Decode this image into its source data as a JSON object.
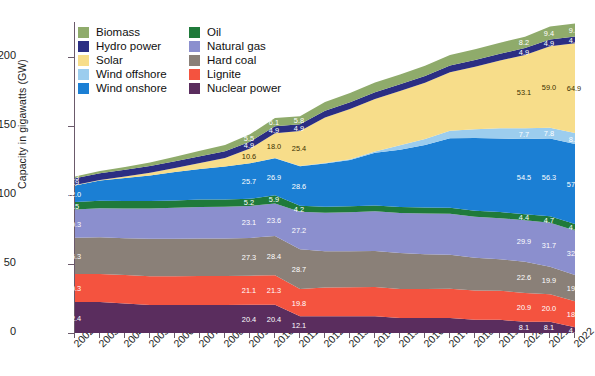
{
  "chart_data": {
    "type": "area",
    "stacked": true,
    "title": "",
    "xlabel": "",
    "ylabel": "Capacity in gigawatts (GW)",
    "ylim": [
      0,
      225
    ],
    "yticks": [
      0,
      50,
      100,
      150,
      200
    ],
    "grid": false,
    "legend_position": "top-left",
    "categories": [
      "2002",
      "2003",
      "2004",
      "2005",
      "2006",
      "2007",
      "2008",
      "2009",
      "2010",
      "2011",
      "2012",
      "2013",
      "2014",
      "2015",
      "2016",
      "2017",
      "2018",
      "2019",
      "2020",
      "2021",
      "2022"
    ],
    "series": [
      {
        "name": "Nuclear power",
        "color": "#5a2d5e",
        "values": [
          22.4,
          22.4,
          21.4,
          20.3,
          20.3,
          20.3,
          20.3,
          20.4,
          20.4,
          12.1,
          12.1,
          12.1,
          12.1,
          10.8,
          10.8,
          10.8,
          9.5,
          9.5,
          8.1,
          8.1,
          4.1
        ],
        "labels": {
          "2002": "22.4",
          "2009": "20.4",
          "2010": "20.4",
          "2011": "12.1",
          "2020": "8.1",
          "2021": "8.1",
          "2022": "4.1"
        }
      },
      {
        "name": "Lignite",
        "color": "#f4533f",
        "values": [
          20.3,
          20.3,
          20.5,
          20.8,
          20.8,
          20.9,
          20.9,
          21.1,
          21.3,
          19.8,
          20.8,
          21.0,
          21.2,
          21.1,
          21.1,
          21.2,
          21.2,
          21.1,
          20.9,
          20.0,
          18.9
        ],
        "labels": {
          "2002": "20.3",
          "2009": "21.1",
          "2010": "21.3",
          "2011": "19.8",
          "2020": "20.9",
          "2021": "20.0",
          "2022": "18.9"
        }
      },
      {
        "name": "Hard coal",
        "color": "#8a8078",
        "values": [
          26.3,
          26.5,
          26.7,
          27.0,
          27.1,
          27.2,
          27.2,
          27.3,
          28.4,
          28.7,
          26.3,
          26.0,
          26.0,
          25.9,
          25.1,
          24.6,
          23.7,
          22.7,
          22.6,
          19.9,
          19.0
        ],
        "labels": {
          "2002": "26.3",
          "2009": "27.3",
          "2010": "28.4",
          "2011": "28.7",
          "2020": "22.6",
          "2021": "19.9",
          "2022": "19.0"
        }
      },
      {
        "name": "Natural gas",
        "color": "#8b8fce",
        "values": [
          20.3,
          21.0,
          21.5,
          22.0,
          22.4,
          22.8,
          23.0,
          23.1,
          23.6,
          27.2,
          27.8,
          28.3,
          28.7,
          29.1,
          29.4,
          29.6,
          29.7,
          29.8,
          29.9,
          31.7,
          32.1
        ],
        "labels": {
          "2002": "20.3",
          "2009": "23.1",
          "2010": "23.6",
          "2011": "27.2",
          "2020": "29.9",
          "2021": "31.7",
          "2022": "32.1"
        }
      },
      {
        "name": "Oil",
        "color": "#1f7a3a",
        "values": [
          5.5,
          5.5,
          5.4,
          5.4,
          5.3,
          5.3,
          5.2,
          5.2,
          5.9,
          4.2,
          4.3,
          4.3,
          4.3,
          4.3,
          4.4,
          4.4,
          4.4,
          4.4,
          4.4,
          4.7,
          4.7
        ],
        "labels": {
          "2002": "5.5",
          "2009": "5.2",
          "2010": "5.9",
          "2011": "4.2",
          "2020": "4.4",
          "2021": "4.7",
          "2022": "4.7"
        }
      },
      {
        "name": "Wind onshore",
        "color": "#1b7fd4",
        "values": [
          12.0,
          14.6,
          16.6,
          18.4,
          20.6,
          22.2,
          23.9,
          25.7,
          26.9,
          28.6,
          31.3,
          33.5,
          38.1,
          41.3,
          45.3,
          50.3,
          52.5,
          53.2,
          54.5,
          56.3,
          57.9
        ],
        "labels": {
          "2002": "12.0",
          "2009": "25.7",
          "2010": "26.9",
          "2011": "28.6",
          "2020": "54.5",
          "2021": "56.3",
          "2022": "57.9"
        }
      },
      {
        "name": "Wind offshore",
        "color": "#9ccdee",
        "values": [
          0.0,
          0.0,
          0.0,
          0.0,
          0.0,
          0.0,
          0.0,
          0.0,
          0.1,
          0.2,
          0.3,
          0.5,
          1.0,
          3.3,
          4.2,
          5.4,
          6.4,
          7.5,
          7.7,
          7.8,
          8.0
        ],
        "labels": {
          "2020": "7.7",
          "2021": "7.8",
          "2022": "8.0"
        }
      },
      {
        "name": "Solar",
        "color": "#f7dd8a",
        "values": [
          0.3,
          0.4,
          1.1,
          2.0,
          2.9,
          4.2,
          6.1,
          10.6,
          18.0,
          25.4,
          33.0,
          36.3,
          37.9,
          39.2,
          40.7,
          42.3,
          45.2,
          48.9,
          53.1,
          59.0,
          64.9
        ],
        "labels": {
          "2009": "10.6",
          "2010": "18.0",
          "2011": "25.4",
          "2020": "53.1",
          "2021": "59.0",
          "2022": "64.9"
        }
      },
      {
        "name": "Hydro power",
        "color": "#2b2e83",
        "values": [
          4.9,
          4.9,
          4.9,
          4.9,
          4.9,
          4.9,
          4.9,
          4.9,
          4.9,
          4.9,
          4.9,
          4.9,
          4.9,
          4.9,
          4.9,
          4.9,
          4.9,
          4.9,
          4.9,
          4.9,
          4.9
        ],
        "labels": {
          "2002": "4.9",
          "2009": "4.9",
          "2010": "4.9",
          "2011": "4.9",
          "2020": "4.9",
          "2021": "4.9",
          "2022": "4.9"
        }
      },
      {
        "name": "Biomass",
        "color": "#8fab6b",
        "values": [
          1.3,
          1.6,
          2.0,
          2.5,
          3.2,
          4.0,
          4.6,
          5.5,
          6.1,
          5.8,
          6.4,
          6.8,
          7.0,
          7.2,
          7.4,
          7.6,
          7.8,
          8.0,
          8.2,
          9.4,
          9.4
        ],
        "labels": {
          "2002": "1.3",
          "2009": "5.5",
          "2010": "6.1",
          "2011": "5.8",
          "2020": "8.2",
          "2021": "9.4",
          "2022": "9.4"
        }
      }
    ]
  },
  "legend": {
    "items": [
      {
        "label": "Biomass",
        "color": "#8fab6b"
      },
      {
        "label": "Oil",
        "color": "#1f7a3a"
      },
      {
        "label": "Hydro power",
        "color": "#2b2e83"
      },
      {
        "label": "Natural gas",
        "color": "#8b8fce"
      },
      {
        "label": "Solar",
        "color": "#f7dd8a"
      },
      {
        "label": "Hard coal",
        "color": "#8a8078"
      },
      {
        "label": "Wind offshore",
        "color": "#9ccdee"
      },
      {
        "label": "Lignite",
        "color": "#f4533f"
      },
      {
        "label": "Wind onshore",
        "color": "#1b7fd4"
      },
      {
        "label": "Nuclear power",
        "color": "#5a2d5e"
      }
    ]
  }
}
